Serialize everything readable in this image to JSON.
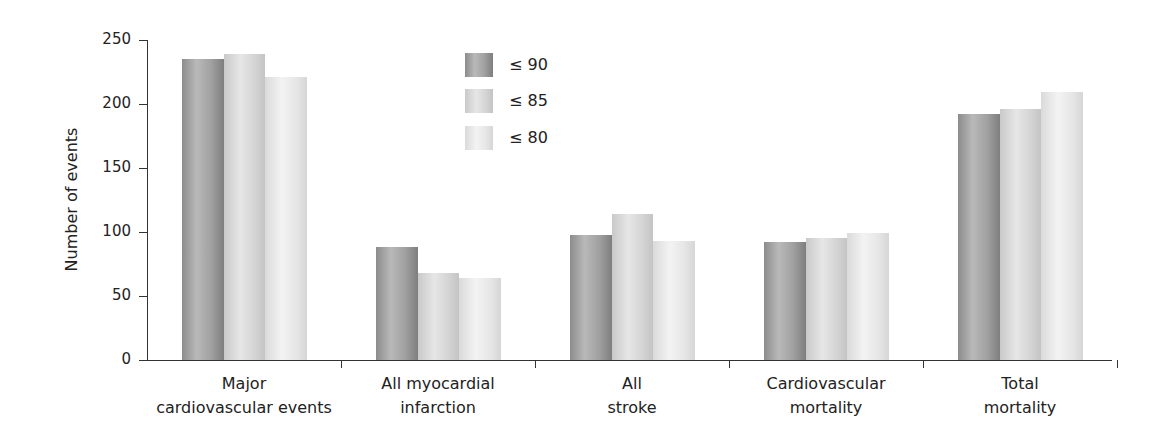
{
  "chart_data": {
    "type": "bar",
    "title": "",
    "xlabel": "",
    "ylabel": "Number of events",
    "ylim": [
      0,
      250
    ],
    "yticks": [
      0,
      50,
      100,
      150,
      200,
      250
    ],
    "grid": false,
    "legend_position": "top-center (inside plot)",
    "categories": [
      [
        "Major",
        "cardiovascular events"
      ],
      [
        "All myocardial",
        "infarction"
      ],
      [
        "All",
        "stroke"
      ],
      [
        "Cardiovascular",
        "mortality"
      ],
      [
        "Total",
        "mortality"
      ]
    ],
    "series": [
      {
        "name": "≤ 90",
        "values": [
          235,
          88,
          98,
          92,
          192
        ]
      },
      {
        "name": "≤ 85",
        "values": [
          239,
          68,
          114,
          95,
          196
        ]
      },
      {
        "name": "≤ 80",
        "values": [
          221,
          64,
          93,
          99,
          209
        ]
      }
    ]
  }
}
